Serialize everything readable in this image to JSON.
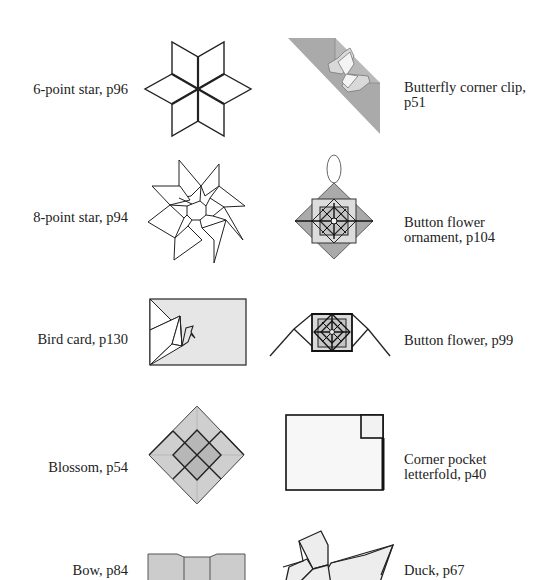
{
  "items": [
    {
      "label": "6-point star, p96",
      "icon": "six-point-star-icon"
    },
    {
      "label": "Butterfly corner clip,",
      "label2": "p51",
      "icon": "butterfly-corner-clip-icon"
    },
    {
      "label": "8-point star, p94",
      "icon": "eight-point-star-icon"
    },
    {
      "label": "Button flower",
      "label2": "ornament, p104",
      "icon": "button-flower-ornament-icon"
    },
    {
      "label": "Bird card, p130",
      "icon": "bird-card-icon"
    },
    {
      "label": "Button flower, p99",
      "icon": "button-flower-icon"
    },
    {
      "label": "Blossom, p54",
      "icon": "blossom-icon"
    },
    {
      "label": "Corner pocket",
      "label2": "letterfold, p40",
      "icon": "corner-pocket-letterfold-icon"
    },
    {
      "label": "Bow, p84",
      "icon": "bow-icon"
    },
    {
      "label": "Duck, p67",
      "icon": "duck-icon"
    }
  ],
  "colors": {
    "line": "#222222",
    "paper_gray": "#b3b3b3",
    "paper_light": "#e6e6e6",
    "blossom_fill": "#c8c8c8",
    "blossom_center": "#b0b0b0"
  }
}
